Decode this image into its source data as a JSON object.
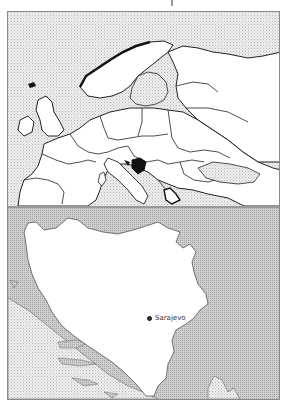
{
  "map": {
    "title": "Bosnia and Herzegovina locator map",
    "overview_panel": {
      "region": "Europe",
      "highlighted_country": "Bosnia and Herzegovina"
    },
    "detail_panel": {
      "country": "Bosnia and Herzegovina",
      "cities": [
        {
          "name": "Sarajevo",
          "type": "capital"
        }
      ]
    },
    "colors": {
      "sea": "#e6e6e6",
      "land": "#ffffff",
      "neighbor_land": "#c6c6c6",
      "highlight": "#111111",
      "border": "#222222",
      "frame": "#8a8a8a"
    }
  }
}
